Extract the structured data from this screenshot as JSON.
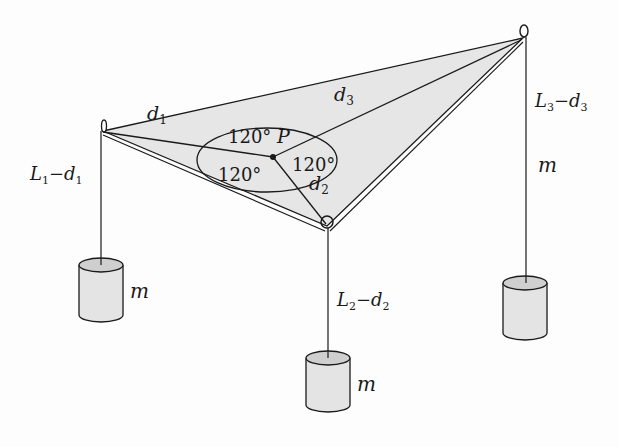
{
  "diagram": {
    "colors": {
      "background": "#fdfdfd",
      "table_fill": "#e6e6e6",
      "ink": "#1a1a1a",
      "mass_fill": "#e4e4e4",
      "mass_top": "#cfcfcf"
    },
    "point": {
      "label": "P"
    },
    "angles": [
      {
        "label": "120°",
        "position": "top"
      },
      {
        "label": "120°",
        "position": "left"
      },
      {
        "label": "120°",
        "position": "right"
      }
    ],
    "segments": [
      {
        "label_main": "d",
        "sub": "1"
      },
      {
        "label_main": "d",
        "sub": "2"
      },
      {
        "label_main": "d",
        "sub": "3"
      }
    ],
    "hanging": [
      {
        "L": "L",
        "Lsub": "1",
        "dash": "−",
        "d": "d",
        "dsub": "1"
      },
      {
        "L": "L",
        "Lsub": "2",
        "dash": "−",
        "d": "d",
        "dsub": "2"
      },
      {
        "L": "L",
        "Lsub": "3",
        "dash": "−",
        "d": "d",
        "dsub": "3"
      }
    ],
    "masses": [
      {
        "label": "m"
      },
      {
        "label": "m"
      },
      {
        "label": "m"
      }
    ]
  }
}
